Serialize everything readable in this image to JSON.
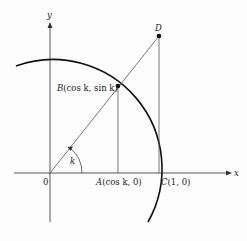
{
  "diagram": {
    "axes": {
      "x_label": "x",
      "y_label": "y",
      "origin_label": "0"
    },
    "angle_label": "k",
    "points": {
      "A": {
        "letter": "A",
        "coords": "(cos k, 0)"
      },
      "B": {
        "letter": "B",
        "coords": "(cos k, sin k)"
      },
      "C": {
        "letter": "C",
        "coords": "(1, 0)"
      },
      "D": {
        "letter": "D"
      }
    },
    "colors": {
      "line": "#444444",
      "arc": "#111111",
      "text": "#222222"
    }
  }
}
